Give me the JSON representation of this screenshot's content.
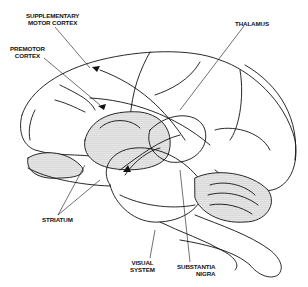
{
  "figure": {
    "labels": {
      "supplementary_motor_cortex": {
        "line1": "SUPPLEMENTARY",
        "line2": "MOTOR CORTEX"
      },
      "premotor_cortex": {
        "line1": "PREMOTOR",
        "line2": "CORTEX"
      },
      "thalamus": {
        "line1": "THALAMUS"
      },
      "striatum": {
        "line1": "STRIATUM"
      },
      "visual_system": {
        "line1": "VISUAL",
        "line2": "SYSTEM"
      },
      "substantia_nigra": {
        "line1": "SUBSTANTIA",
        "line2": "NIGRA"
      }
    },
    "colors": {
      "ink": "#111111",
      "background": "#ffffff",
      "shade": "#9a9a9a"
    }
  }
}
